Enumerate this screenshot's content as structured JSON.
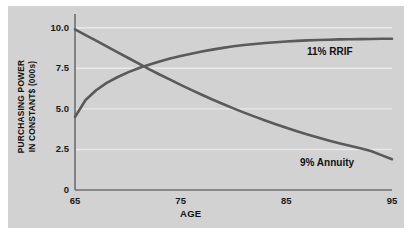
{
  "chart_data": {
    "type": "line",
    "title": "",
    "xlabel": "AGE",
    "ylabel_line1": "PURCHASING POWER",
    "ylabel_line2": "IN CONSTANT$ (000s)",
    "xlim": [
      65,
      95
    ],
    "ylim": [
      0,
      10.6
    ],
    "xticks": [
      "65",
      "75",
      "85",
      "95"
    ],
    "xtick_values": [
      65,
      75,
      85,
      95
    ],
    "yticks": [
      "10.0",
      "7.5",
      "5.0",
      "2.5",
      "0"
    ],
    "ytick_values": [
      10.0,
      7.5,
      5.0,
      2.5,
      0
    ],
    "grid": "horizontal",
    "legend_position": "inline-annotations",
    "x": [
      65,
      66,
      67,
      68,
      69,
      70,
      71,
      72,
      73,
      74,
      75,
      76,
      77,
      78,
      79,
      80,
      81,
      82,
      83,
      84,
      85,
      86,
      87,
      88,
      89,
      90,
      91,
      92,
      93,
      94,
      95
    ],
    "series": [
      {
        "name": "11% RRIF",
        "color": "#5a5a5a",
        "values": [
          4.5,
          5.55,
          6.15,
          6.6,
          6.95,
          7.25,
          7.5,
          7.72,
          7.92,
          8.1,
          8.26,
          8.4,
          8.53,
          8.65,
          8.76,
          8.86,
          8.94,
          9.0,
          9.06,
          9.11,
          9.15,
          9.19,
          9.22,
          9.24,
          9.26,
          9.28,
          9.29,
          9.3,
          9.31,
          9.32,
          9.32
        ]
      },
      {
        "name": "9% Annuity",
        "color": "#5a5a5a",
        "values": [
          9.9,
          9.55,
          9.2,
          8.85,
          8.5,
          8.15,
          7.8,
          7.45,
          7.12,
          6.8,
          6.48,
          6.17,
          5.87,
          5.58,
          5.3,
          5.03,
          4.77,
          4.52,
          4.28,
          4.05,
          3.83,
          3.62,
          3.42,
          3.23,
          3.05,
          2.88,
          2.72,
          2.57,
          2.4,
          2.15,
          1.9
        ]
      }
    ],
    "annotations": [
      {
        "text": "11% RRIF",
        "x": 88,
        "y": 8.3
      },
      {
        "text": "9% Annuity",
        "x": 87.5,
        "y": 2.6
      }
    ]
  },
  "colors": {
    "panel_background": "#d2d2d2",
    "figure_background": "#ffffff",
    "line": "#5a5a5a",
    "axis": "#6e6e6e",
    "grid": "#e8e8e8",
    "text": "#111111"
  }
}
